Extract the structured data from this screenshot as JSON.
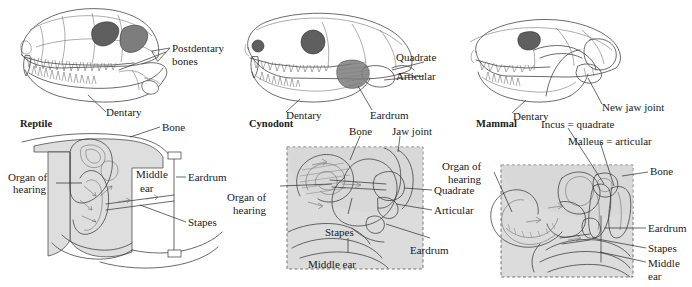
{
  "figure": {
    "title_present": false,
    "columns": [
      {
        "key": "reptile",
        "stage_label": "Reptile",
        "skull_labels": [
          "Postdentary bones",
          "Dentary"
        ],
        "ear_labels": [
          "Bone",
          "Organ of hearing",
          "Middle ear",
          "Eardrum",
          "Stapes"
        ]
      },
      {
        "key": "cynodont",
        "stage_label": "Cynodont",
        "skull_labels": [
          "Quadrate",
          "Articular",
          "Dentary",
          "Eardrum"
        ],
        "ear_labels": [
          "Bone",
          "Jaw joint",
          "Organ of hearing",
          "Quadrate",
          "Articular",
          "Stapes",
          "Eardrum",
          "Middle ear"
        ]
      },
      {
        "key": "mammal",
        "stage_label": "Mammal",
        "skull_labels": [
          "Dentary",
          "New jaw joint"
        ],
        "ear_labels": [
          "Incus = quadrate",
          "Malleus = articular",
          "Organ of hearing",
          "Bone",
          "Eardrum",
          "Stapes",
          "Middle ear"
        ]
      }
    ]
  },
  "labels": {
    "reptile_stage": "Reptile",
    "cynodont_stage": "Cynodont",
    "mammal_stage": "Mammal",
    "postdentary_line1": "Postdentary",
    "postdentary_line2": "bones",
    "dentary_reptile": "Dentary",
    "bone_reptile": "Bone",
    "organ_of_line1_reptile": "Organ of",
    "organ_of_line2_reptile": "hearing",
    "middle_line1_reptile": "Middle",
    "middle_line2_reptile": "ear",
    "eardrum_reptile": "Eardrum",
    "stapes_reptile": "Stapes",
    "quadrate_skull_cyn": "Quadrate",
    "articular_skull_cyn": "Articular",
    "dentary_cyn": "Dentary",
    "eardrum_skull_cyn": "Eardrum",
    "bone_cyn": "Bone",
    "jaw_joint_cyn": "Jaw joint",
    "organ_of_line1_cyn": "Organ of",
    "organ_of_line2_cyn": "hearing",
    "quadrate_ear_cyn": "Quadrate",
    "articular_ear_cyn": "Articular",
    "stapes_cyn": "Stapes",
    "eardrum_ear_cyn": "Eardrum",
    "middle_ear_cyn": "Middle ear",
    "dentary_mam": "Dentary",
    "new_jaw_joint_mam": "New jaw joint",
    "incus_eq_quadrate": "Incus = quadrate",
    "malleus_eq_articular": "Malleus = articular",
    "organ_of_line1_mam": "Organ of",
    "organ_of_line2_mam": "hearing",
    "bone_mam": "Bone",
    "eardrum_mam": "Eardrum",
    "stapes_mam": "Stapes",
    "middle_line1_mam": "Middle",
    "middle_line2_mam": "ear"
  },
  "colors": {
    "ink": "#2a2a2a",
    "shade_fill": "#dedede",
    "dashed_box": "#555555",
    "background": "#ffffff",
    "dark_fenestra": "#5f5f5f"
  }
}
